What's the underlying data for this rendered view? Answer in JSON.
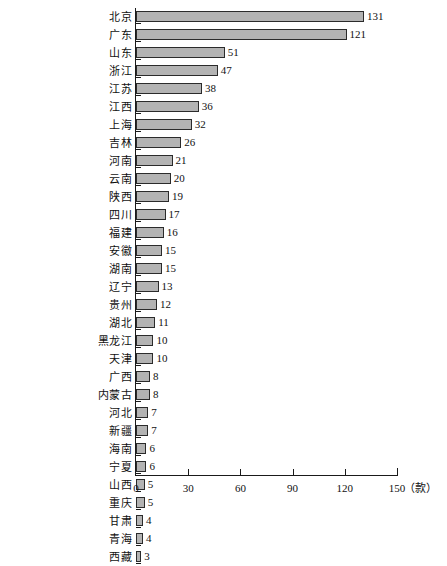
{
  "chart_data": {
    "type": "bar",
    "orientation": "horizontal",
    "title": "",
    "subtitle": "",
    "xlabel": "",
    "ylabel": "",
    "unit_label": "（款）",
    "xlim": [
      0,
      150
    ],
    "xticks": [
      0,
      30,
      60,
      90,
      120,
      150
    ],
    "xtick_labels": [
      "0",
      "30",
      "60",
      "90",
      "120",
      "150"
    ],
    "grid": false,
    "legend": null,
    "bar_color": "#b3b3b3",
    "bar_edge_color": "#2b2b2b",
    "categories": [
      "北京",
      "广东",
      "山东",
      "浙江",
      "江苏",
      "江西",
      "上海",
      "吉林",
      "河南",
      "云南",
      "陕西",
      "四川",
      "福建",
      "安徽",
      "湖南",
      "辽宁",
      "贵州",
      "湖北",
      "黑龙江",
      "天津",
      "广西",
      "内蒙古",
      "河北",
      "新疆",
      "海南",
      "宁夏",
      "山西",
      "重庆",
      "甘肃",
      "青海",
      "西藏"
    ],
    "values": [
      131,
      121,
      51,
      47,
      38,
      36,
      32,
      26,
      21,
      20,
      19,
      17,
      16,
      15,
      15,
      13,
      12,
      11,
      10,
      10,
      8,
      8,
      7,
      7,
      6,
      6,
      5,
      5,
      4,
      4,
      3
    ],
    "value_labels": [
      "131",
      "121",
      "51",
      "47",
      "38",
      "36",
      "32",
      "26",
      "21",
      "20",
      "19",
      "17",
      "16",
      "15",
      "15",
      "13",
      "12",
      "11",
      "10",
      "10",
      "8",
      "8",
      "7",
      "7",
      "6",
      "6",
      "5",
      "5",
      "4",
      "4",
      "3"
    ]
  }
}
